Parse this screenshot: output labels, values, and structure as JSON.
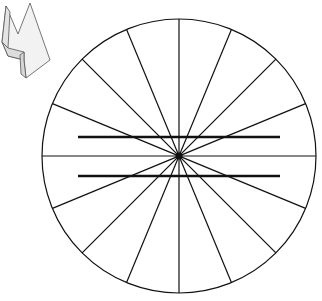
{
  "figure": {
    "width": 322,
    "height": 301,
    "background": "#ffffff",
    "stroke_color": "#111111",
    "circle": {
      "cx": 179,
      "cy": 156,
      "r": 137,
      "stroke_width": 1.2
    },
    "rays": {
      "count": 16,
      "angle_step_deg": 22.5,
      "stroke_width": 1.2
    },
    "center_dot": {
      "r": 3.5
    },
    "parallel_lines": [
      {
        "x1": 78,
        "x2": 280,
        "y": 137,
        "stroke_width": 2.6
      },
      {
        "x1": 78,
        "x2": 280,
        "y": 176,
        "stroke_width": 2.6
      }
    ],
    "arrow_icon": {
      "semantic": "3d-arrow-icon",
      "fill": "#eeeeee",
      "edge": "#555555"
    }
  }
}
